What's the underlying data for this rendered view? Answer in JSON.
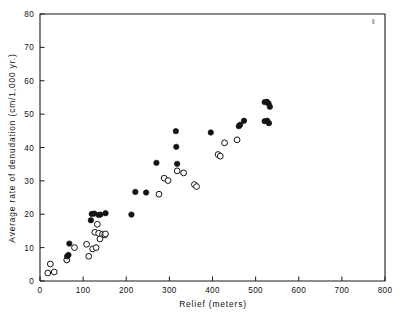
{
  "chart_data": {
    "type": "scatter",
    "title": "",
    "xlabel": "Relief (meters)",
    "ylabel": "Average rate of denudation (cm/1,000 yr.)",
    "xlim": [
      0,
      800
    ],
    "ylim": [
      0,
      80
    ],
    "xticks": [
      0,
      100,
      200,
      300,
      400,
      500,
      600,
      700,
      800
    ],
    "yticks": [
      0,
      10,
      20,
      30,
      40,
      50,
      60,
      70,
      80
    ],
    "xticklabels": [
      "0",
      "100",
      "200",
      "300",
      "400",
      "500",
      "600",
      "700",
      "800"
    ],
    "yticklabels": [
      "0",
      "10",
      "20",
      "30",
      "40",
      "50",
      "60",
      "70",
      "80"
    ],
    "grid": false,
    "legend_position": "none",
    "series": [
      {
        "name": "filled-circles",
        "marker": "filled-circle",
        "color": "#141414",
        "points": [
          [
            63,
            7.4
          ],
          [
            66,
            7.8
          ],
          [
            68,
            11.2
          ],
          [
            118,
            18.2
          ],
          [
            120,
            20.1
          ],
          [
            126,
            20.2
          ],
          [
            136,
            19.8
          ],
          [
            140,
            19.9
          ],
          [
            152,
            20.3
          ],
          [
            212,
            19.9
          ],
          [
            221,
            26.7
          ],
          [
            246,
            26.5
          ],
          [
            270,
            35.4
          ],
          [
            315,
            44.9
          ],
          [
            316,
            40.2
          ],
          [
            318,
            35.1
          ],
          [
            396,
            44.5
          ],
          [
            461,
            46.4
          ],
          [
            464,
            46.8
          ],
          [
            473,
            48.0
          ],
          [
            521,
            53.6
          ],
          [
            526,
            53.7
          ],
          [
            530,
            53.2
          ],
          [
            533,
            52.2
          ],
          [
            521,
            47.9
          ],
          [
            527,
            48.0
          ],
          [
            531,
            47.3
          ]
        ]
      },
      {
        "name": "open-circles",
        "marker": "open-circle",
        "color": "#ffffff",
        "points": [
          [
            18,
            2.4
          ],
          [
            24,
            5.1
          ],
          [
            33,
            2.7
          ],
          [
            62,
            6.3
          ],
          [
            80,
            10.0
          ],
          [
            108,
            11.0
          ],
          [
            113,
            7.4
          ],
          [
            122,
            9.6
          ],
          [
            127,
            14.6
          ],
          [
            130,
            10.0
          ],
          [
            133,
            17.0
          ],
          [
            136,
            14.3
          ],
          [
            139,
            12.6
          ],
          [
            145,
            14.0
          ],
          [
            150,
            13.8
          ],
          [
            152,
            14.1
          ],
          [
            276,
            26.0
          ],
          [
            288,
            30.8
          ],
          [
            297,
            30.1
          ],
          [
            318,
            33.0
          ],
          [
            333,
            32.4
          ],
          [
            358,
            28.9
          ],
          [
            363,
            28.3
          ],
          [
            413,
            37.9
          ],
          [
            418,
            37.4
          ],
          [
            428,
            41.4
          ],
          [
            457,
            42.3
          ]
        ]
      }
    ]
  },
  "figure": {
    "corner_mark": "•"
  }
}
